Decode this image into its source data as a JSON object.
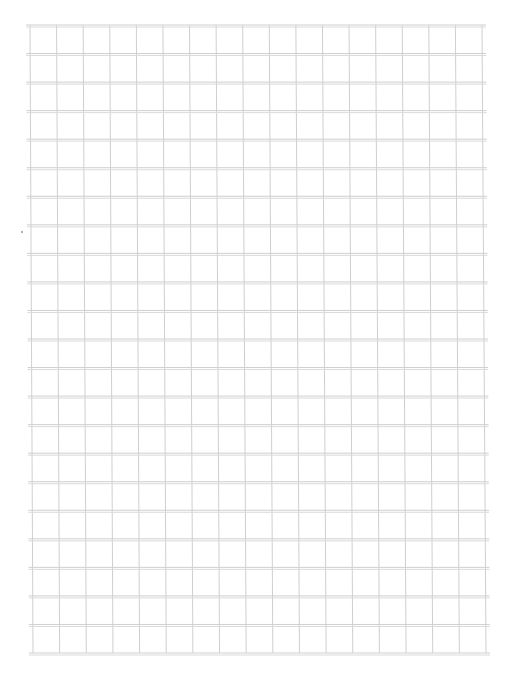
{
  "sheet": {
    "type": "grid-paper",
    "columns": 17,
    "rows": 22,
    "grid_left_top": 30,
    "grid_left_bottom": 33,
    "grid_right_top": 482,
    "grid_right_bottom": 486,
    "grid_top": 25,
    "grid_bottom": 653,
    "horizontal_line_overhang": 4,
    "line_color": "#cfcfcf",
    "line_color_double": "#dadada",
    "background": "#ffffff"
  },
  "marks": [
    {
      "name": "stray-dot",
      "x": 21,
      "y": 231,
      "color": "#9a9a9a"
    }
  ]
}
